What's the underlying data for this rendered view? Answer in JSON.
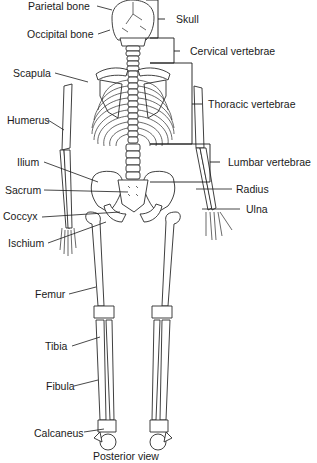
{
  "figure": {
    "caption": "Posterior view"
  },
  "labels_left": [
    {
      "id": "parietal",
      "text": "Parietal bone"
    },
    {
      "id": "occipital",
      "text": "Occipital bone"
    },
    {
      "id": "scapula",
      "text": "Scapula"
    },
    {
      "id": "humerus",
      "text": "Humerus"
    },
    {
      "id": "ilium",
      "text": "Ilium"
    },
    {
      "id": "sacrum",
      "text": "Sacrum"
    },
    {
      "id": "coccyx",
      "text": "Coccyx"
    },
    {
      "id": "ischium",
      "text": "Ischium"
    },
    {
      "id": "femur",
      "text": "Femur"
    },
    {
      "id": "tibia",
      "text": "Tibia"
    },
    {
      "id": "fibula",
      "text": "Fibula"
    },
    {
      "id": "calcaneus",
      "text": "Calcaneus"
    }
  ],
  "labels_right": [
    {
      "id": "skull",
      "text": "Skull"
    },
    {
      "id": "cervical",
      "text": "Cervical vertebrae"
    },
    {
      "id": "thoracic",
      "text": "Thoracic vertebrae"
    },
    {
      "id": "lumbar",
      "text": "Lumbar vertebrae"
    },
    {
      "id": "radius",
      "text": "Radius"
    },
    {
      "id": "ulna",
      "text": "Ulna"
    }
  ]
}
